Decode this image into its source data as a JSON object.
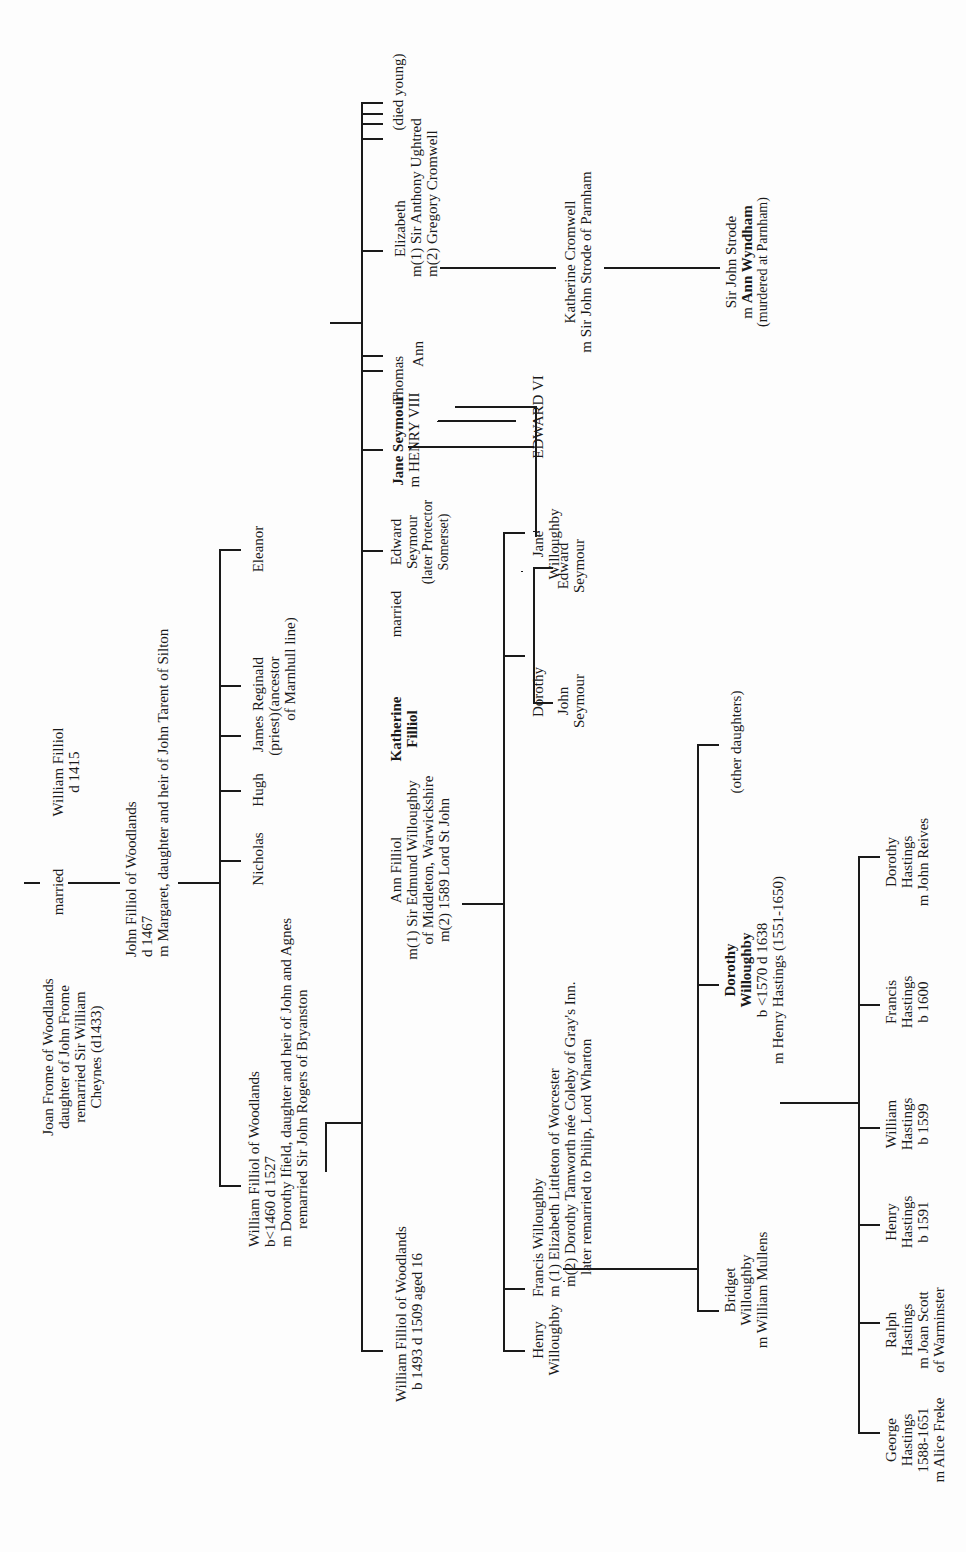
{
  "tree": {
    "gen1": {
      "joan": [
        "Joan Frome of Woodlands",
        "daughter of John Frome",
        "remarried Sir William",
        "Cheynes (d1433)"
      ],
      "married": "married",
      "william": [
        "William Filliol",
        "d 1415"
      ]
    },
    "gen2": {
      "john": [
        "John Filliol of Woodlands",
        "d 1467",
        "m Margaret, daughter and heir of John Tarent of Silton"
      ]
    },
    "gen3": {
      "william": [
        "William Filliol of Woodlands",
        "b<1460  d 1527",
        "m Dorothy Ifield, daughter and heir of John and Agnes",
        "remarried Sir John Rogers of Bryanston"
      ],
      "nicholas": "Nicholas",
      "hugh": "Hugh",
      "james": [
        "James",
        "(priest)"
      ],
      "reginald": [
        "Reginald",
        "(ancestor",
        "of Marnhull line)"
      ],
      "eleanor": "Eleanor"
    },
    "gen4": {
      "william": [
        "William Filliol of Woodlands",
        "b 1493   d 1509 aged 16"
      ],
      "ann": [
        "Ann Filliol",
        "m(1) Sir Edmund Willoughby",
        "of Middleton, Warwickshire",
        "m(2)  1589 Lord St John"
      ],
      "katherine_name": "Katherine",
      "katherine_surname": "Filliol",
      "katherine_married": "married",
      "edward": [
        "Edward",
        "Seymour",
        "(later Protector",
        "Somerset)"
      ],
      "jane_name": "Jane Seymour",
      "jane_spouse": "m HENRY VIII",
      "thomas": "Thomas",
      "ann_seymour": "Ann",
      "elizabeth": [
        "Elizabeth",
        "m(1) Sir Anthony Ughtred",
        "m(2) Gregory Cromwell"
      ],
      "died_young": "(died young)"
    },
    "gen5": {
      "henry": [
        "Henry",
        "Willoughby"
      ],
      "francis": [
        "Francis Willoughby",
        "m (1) Elizabeth Littleton of Worcester",
        "m(2) Dorothy Tamworth née Coleby  of Gray's Inn.",
        "later remarried to Philip, Lord Wharton"
      ],
      "dorothy": "Dorothy",
      "jane": [
        "Jane",
        "Willoughby"
      ],
      "john_seymour": [
        "John",
        "Seymour"
      ],
      "edward_seymour": [
        "Edward",
        "Seymour"
      ],
      "edward_vi": "EDWARD VI",
      "katherine_cromwell": [
        "Katherine Cromwell",
        "m Sir John Strode of Parnham"
      ]
    },
    "gen6": {
      "bridget": [
        "Bridget",
        "Willoughby",
        "m William Mullens"
      ],
      "dorothy_name": [
        "Dorothy",
        "Willoughby"
      ],
      "dorothy_detail": [
        "b <1570  d 1638",
        "m Henry Hastings (1551-1650)"
      ],
      "other_daughters": "(other daughters)",
      "john_strode": "Sir John Strode",
      "ann_wyndham_prefix": "m ",
      "ann_wyndham": "Ann Wyndham",
      "ann_wyndham_note": "(murdered at Parnham)"
    },
    "gen7": {
      "george": [
        "George",
        "Hastings",
        "1588-1651",
        "m Alice Freke"
      ],
      "ralph": [
        "Ralph",
        "Hastings",
        "m Joan Scott",
        "of Warminster"
      ],
      "henry": [
        "Henry",
        "Hastings",
        "b 1591"
      ],
      "william": [
        "William",
        "Hastings",
        "b 1599"
      ],
      "francis": [
        "Francis",
        "Hastings",
        "b 1600"
      ],
      "dorothy": [
        "Dorothy",
        "Hastings",
        "m John Reives"
      ]
    }
  }
}
